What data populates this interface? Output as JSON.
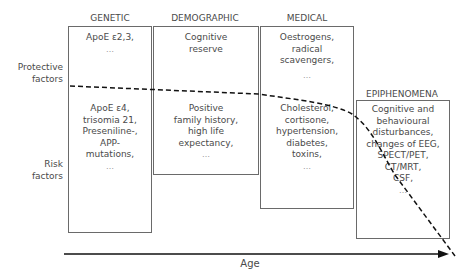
{
  "side_labels": {
    "protective": [
      "Protective",
      "factors"
    ],
    "risk": [
      "Risk",
      "factors"
    ]
  },
  "columns": [
    {
      "header": "GENETIC",
      "protective": [
        "ApoE ε2,3,",
        "…"
      ],
      "risk": [
        "ApoE ε4,",
        "trisomia 21,",
        "Preseniline-,",
        "APP-",
        "mutations,",
        "…"
      ]
    },
    {
      "header": "DEMOGRAPHIC",
      "protective": [
        "Cognitive",
        "reserve"
      ],
      "risk": [
        "Positive",
        "family history,",
        "high life",
        "expectancy,",
        "…"
      ]
    },
    {
      "header": "MEDICAL",
      "protective": [
        "Oestrogens,",
        "radical",
        "scavengers,",
        "…"
      ],
      "risk": [
        "Cholesterol,",
        "cortisone,",
        "hypertension,",
        "diabetes,",
        "toxins,",
        "…"
      ]
    },
    {
      "header": "EPIPHENOMENA",
      "risk": [
        "Cognitive and",
        "behavioural",
        "disturbances,",
        "changes of EEG,",
        "SPECT/PET,",
        "CT/MRT,",
        "CSF,",
        "…"
      ]
    }
  ],
  "axis": {
    "label": "Age"
  },
  "colors": {
    "line": "#111111",
    "box_border": "#6a6a6a",
    "text": "#4a4a4a"
  }
}
